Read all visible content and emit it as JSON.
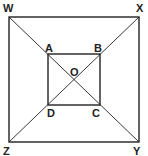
{
  "diagram": {
    "type": "geometry",
    "stroke_color": "#222222",
    "background": "#ffffff",
    "outer_square": {
      "vertices": [
        {
          "label": "W",
          "x": 9,
          "y": 17
        },
        {
          "label": "X",
          "x": 139,
          "y": 17
        },
        {
          "label": "Y",
          "x": 139,
          "y": 142
        },
        {
          "label": "Z",
          "x": 9,
          "y": 142
        }
      ]
    },
    "inner_square": {
      "vertices": [
        {
          "label": "A",
          "x": 48,
          "y": 54
        },
        {
          "label": "B",
          "x": 100,
          "y": 54
        },
        {
          "label": "C",
          "x": 100,
          "y": 105
        },
        {
          "label": "D",
          "x": 48,
          "y": 105
        }
      ]
    },
    "center": {
      "label": "O",
      "x": 74,
      "y": 79
    },
    "diagonals": [
      {
        "from": "W",
        "to": "Y"
      },
      {
        "from": "X",
        "to": "Z"
      }
    ],
    "labels": {
      "W": "W",
      "X": "X",
      "Y": "Y",
      "Z": "Z",
      "A": "A",
      "B": "B",
      "C": "C",
      "D": "D",
      "O": "O"
    }
  }
}
